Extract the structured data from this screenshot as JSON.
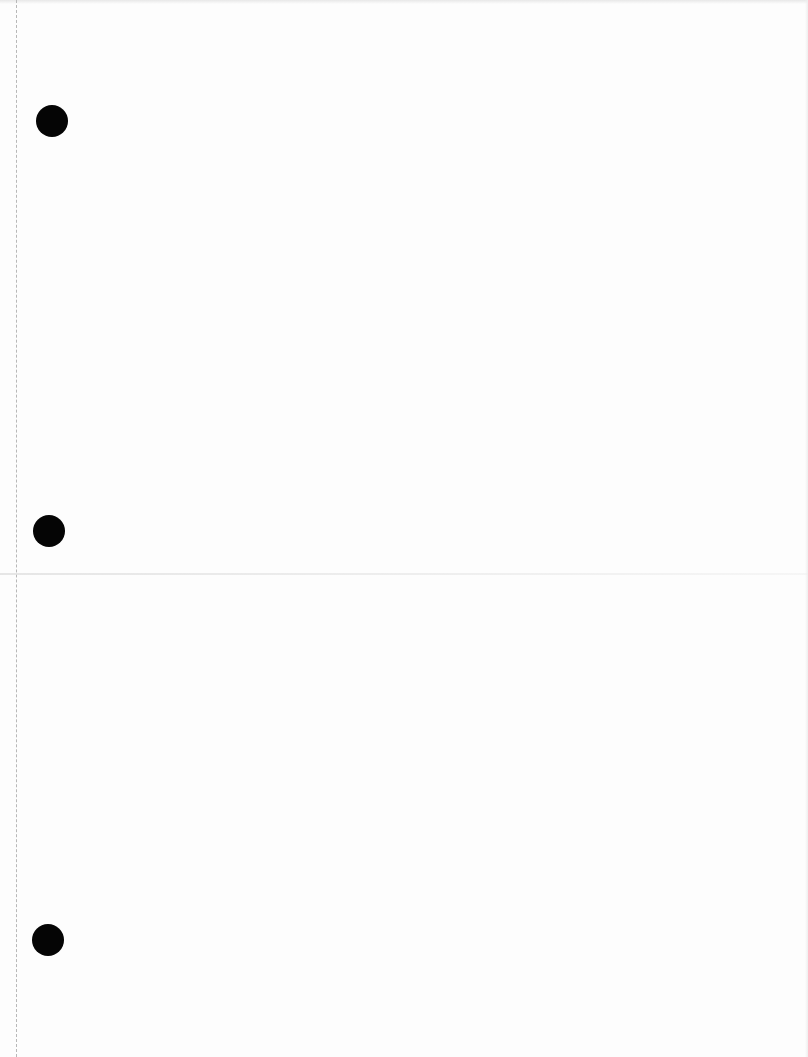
{
  "document": {
    "type": "blank scanned page",
    "text_content": [],
    "punch_holes": [
      {
        "x": 52,
        "y": 121
      },
      {
        "x": 49,
        "y": 531
      },
      {
        "x": 48,
        "y": 940
      }
    ],
    "colors": {
      "paper": "#fdfdfd",
      "hole": "#050505",
      "margin_line": "#b8b8b8"
    }
  }
}
